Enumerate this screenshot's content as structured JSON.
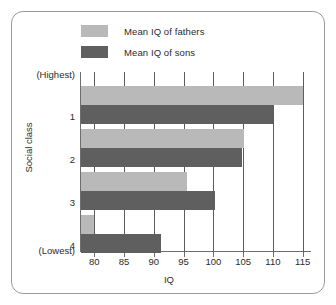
{
  "chart_data": {
    "type": "bar",
    "orientation": "horizontal",
    "title": "",
    "xlabel": "IQ",
    "ylabel": "Social class",
    "xlim": [
      77.6,
      116.4
    ],
    "xticks": [
      80,
      85,
      90,
      95,
      100,
      105,
      110,
      115
    ],
    "grid": "vertical",
    "categories": [
      "1",
      "2",
      "3",
      "4"
    ],
    "category_extremes": {
      "top": "(Highest)",
      "bottom": "(Lowest)"
    },
    "legend_position": "top-left",
    "series": [
      {
        "name": "Mean IQ of fathers",
        "color": "#b9b9b9",
        "values": [
          115.0,
          105.2,
          95.6,
          80.0
        ]
      },
      {
        "name": "Mean IQ of sons",
        "color": "#5f5f5f",
        "values": [
          110.0,
          104.8,
          100.2,
          91.2
        ]
      }
    ]
  },
  "legend": {
    "items": [
      {
        "label": "Mean IQ of fathers",
        "color": "#b9b9b9"
      },
      {
        "label": "Mean IQ of sons",
        "color": "#5f5f5f"
      }
    ]
  },
  "axes": {
    "x_title": "IQ",
    "y_title": "Social class",
    "x_tick_labels": [
      "80",
      "85",
      "90",
      "95",
      "100",
      "105",
      "110",
      "115"
    ],
    "y_tick_labels": [
      "(Highest)",
      "1",
      "2",
      "3",
      "4",
      "(Lowest)"
    ]
  },
  "colors": {
    "frame": "#9a9a9a",
    "axis": "#6e6e6e",
    "grid": "#5c5c5c",
    "light_bar": "#b9b9b9",
    "dark_bar": "#5f5f5f",
    "text": "#2b2b2b",
    "background": "#ffffff"
  }
}
